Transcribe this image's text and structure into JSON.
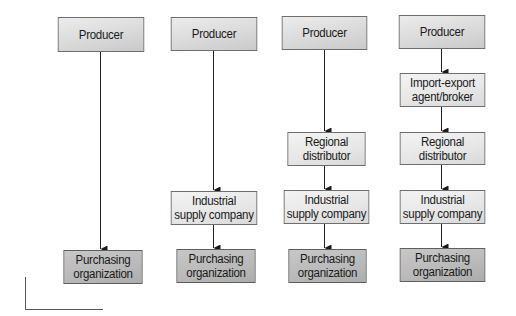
{
  "diagram": {
    "type": "distribution-channels-flowchart",
    "columns": [
      {
        "id": "channel-1",
        "nodes": [
          {
            "role": "producer",
            "label": "Producer"
          },
          {
            "role": "purchasing",
            "label": "Purchasing\norganization"
          }
        ]
      },
      {
        "id": "channel-2",
        "nodes": [
          {
            "role": "producer",
            "label": "Producer"
          },
          {
            "role": "industrial-supply",
            "label": "Industrial\nsupply company"
          },
          {
            "role": "purchasing",
            "label": "Purchasing\norganization"
          }
        ]
      },
      {
        "id": "channel-3",
        "nodes": [
          {
            "role": "producer",
            "label": "Producer"
          },
          {
            "role": "regional-distributor",
            "label": "Regional\ndistributor"
          },
          {
            "role": "industrial-supply",
            "label": "Industrial\nsupply company"
          },
          {
            "role": "purchasing",
            "label": "Purchasing\norganization"
          }
        ]
      },
      {
        "id": "channel-4",
        "nodes": [
          {
            "role": "producer",
            "label": "Producer"
          },
          {
            "role": "import-export",
            "label": "Import-export\nagent/broker"
          },
          {
            "role": "regional-distributor",
            "label": "Regional\ndistributor"
          },
          {
            "role": "industrial-supply",
            "label": "Industrial\nsupply company"
          },
          {
            "role": "purchasing",
            "label": "Purchasing\norganization"
          }
        ]
      }
    ],
    "colors": {
      "border": "#6e6e6e",
      "arrow": "#222222",
      "producer_fill": "#dadada",
      "intermediate_fill": "#e6e6e6",
      "purchasing_fill": "#b9b9b9",
      "corner_mark": "#555555"
    }
  }
}
